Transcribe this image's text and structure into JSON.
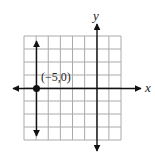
{
  "figure": {
    "x_axis_label": "x",
    "y_axis_label": "y",
    "point_label": "(−5,0)",
    "grid": {
      "x_min": -6,
      "x_max": 2,
      "y_min": -4,
      "y_max": 4,
      "step": 1,
      "grid_color": "#aaaaaa"
    },
    "point": {
      "x": -5,
      "y": 0
    },
    "line": {
      "type": "vertical",
      "equation": "x = -5"
    },
    "colors": {
      "axes": "#111111",
      "line": "#111111",
      "point": "#111111",
      "grid": "#aaaaaa"
    }
  }
}
